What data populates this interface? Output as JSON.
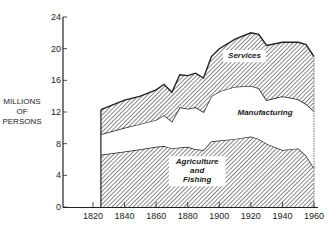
{
  "chart_data": {
    "type": "area",
    "stacked": true,
    "title": "",
    "xlabel": "",
    "ylabel": "MILLIONS OF PERSONS",
    "ylabel_lines": [
      "MILLIONS",
      "OF",
      "PERSONS"
    ],
    "xlim": [
      1810,
      1965
    ],
    "ylim": [
      0,
      24
    ],
    "xticks": [
      1820,
      1840,
      1860,
      1880,
      1900,
      1920,
      1940,
      1960
    ],
    "yticks": [
      0,
      4,
      8,
      12,
      16,
      20,
      24
    ],
    "grid": false,
    "legend": "inline labels",
    "x": [
      1825,
      1840,
      1850,
      1860,
      1865,
      1870,
      1875,
      1880,
      1885,
      1890,
      1895,
      1900,
      1910,
      1920,
      1925,
      1930,
      1940,
      1950,
      1955,
      1960
    ],
    "series": [
      {
        "name": "Agriculture and Fishing",
        "label_lines": [
          "Agriculture",
          "and",
          "Fishing"
        ],
        "fill": "hatched",
        "cumulative_top": [
          6.6,
          7.0,
          7.3,
          7.6,
          7.7,
          7.4,
          7.5,
          7.6,
          7.3,
          7.2,
          8.3,
          8.4,
          8.6,
          8.9,
          8.6,
          8.0,
          7.2,
          7.4,
          6.5,
          4.9
        ]
      },
      {
        "name": "Manufacturing",
        "label_lines": [
          "Manufacturing"
        ],
        "fill": "white",
        "cumulative_top": [
          9.2,
          10.0,
          10.5,
          11.0,
          11.6,
          10.8,
          12.6,
          12.4,
          12.6,
          12.0,
          14.0,
          14.6,
          15.2,
          15.3,
          15.0,
          13.5,
          14.0,
          13.6,
          13.0,
          12.1
        ]
      },
      {
        "name": "Services",
        "label_lines": [
          "Services"
        ],
        "fill": "hatched",
        "cumulative_top": [
          12.3,
          13.5,
          14.0,
          14.8,
          15.5,
          14.5,
          16.7,
          16.6,
          16.9,
          16.3,
          19.0,
          20.0,
          21.2,
          22.0,
          21.8,
          20.4,
          20.8,
          20.8,
          20.5,
          19.0
        ]
      }
    ]
  },
  "colors": {
    "ink": "#222222",
    "background": "#ffffff",
    "hatch": "#555555"
  }
}
